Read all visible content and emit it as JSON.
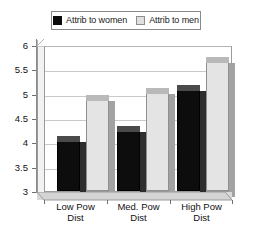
{
  "chart_data": {
    "type": "bar",
    "title": "",
    "xlabel": "",
    "ylabel": "",
    "categories": [
      "Low Pow Dist",
      "Med. Pow Dist",
      "High Pow Dist"
    ],
    "category_lines": [
      [
        "Low Pow",
        "Dist"
      ],
      [
        "Med. Pow",
        "Dist"
      ],
      [
        "High Pow",
        "Dist"
      ]
    ],
    "series": [
      {
        "name": "Attrib to women",
        "color": "#0d0d0d",
        "values": [
          4.15,
          4.35,
          5.2
        ]
      },
      {
        "name": "Attrib to men",
        "color": "#e4e4e4",
        "values": [
          5.0,
          5.15,
          5.8
        ]
      }
    ],
    "ylim": [
      3,
      6
    ],
    "ytick_labels": [
      "6",
      "5.5",
      "5",
      "4.5",
      "4",
      "3.5",
      "3"
    ],
    "ytick_values": [
      6,
      5.5,
      5,
      4.5,
      4,
      3.5,
      3
    ],
    "grid": true,
    "legend_position": "top",
    "style": "3d-column"
  },
  "legend": {
    "entries": [
      {
        "label": "Attrib to women",
        "swatch": "black-square-swatch"
      },
      {
        "label": "Attrib to men",
        "swatch": "light-gray-square-swatch"
      }
    ]
  }
}
